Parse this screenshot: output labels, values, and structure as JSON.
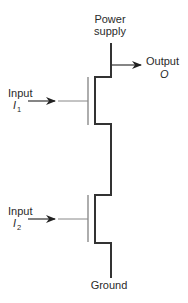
{
  "diagram": {
    "power_label_line1": "Power",
    "power_label_line2": "supply",
    "output_label": "Output",
    "output_symbol": "O",
    "input1_label": "Input",
    "input1_symbol": "I",
    "input1_sub": "1",
    "input2_label": "Input",
    "input2_symbol": "I",
    "input2_sub": "2",
    "ground_label": "Ground",
    "colors": {
      "background": "#ffffff",
      "wire": "#333333",
      "gate_wire": "#888888",
      "text": "#2a2a2a"
    }
  }
}
